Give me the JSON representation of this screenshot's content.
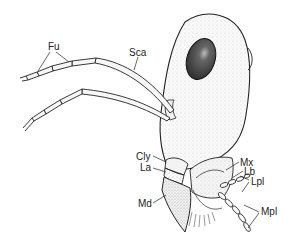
{
  "figure": {
    "labels": [
      {
        "id": "fu",
        "text": "Fu",
        "x": 48,
        "y": 42
      },
      {
        "id": "sca",
        "text": "Sca",
        "x": 129,
        "y": 48
      },
      {
        "id": "cly",
        "text": "Cly",
        "x": 136,
        "y": 152
      },
      {
        "id": "la",
        "text": "La",
        "x": 140,
        "y": 163
      },
      {
        "id": "md",
        "text": "Md",
        "x": 138,
        "y": 199
      },
      {
        "id": "mx",
        "text": "Mx",
        "x": 240,
        "y": 158
      },
      {
        "id": "lb",
        "text": "Lb",
        "x": 244,
        "y": 167
      },
      {
        "id": "lpl",
        "text": "Lpl",
        "x": 251,
        "y": 177
      },
      {
        "id": "mpl",
        "text": "Mpl",
        "x": 261,
        "y": 207
      }
    ]
  }
}
